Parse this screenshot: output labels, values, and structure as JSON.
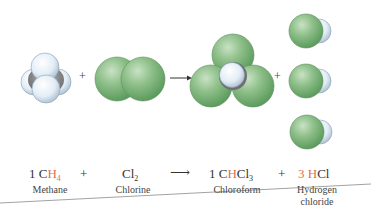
{
  "equation": {
    "reactants": [
      {
        "coef": "1",
        "formula_main": "C",
        "formula_hl": "H",
        "formula_sub": "4",
        "name": "Methane"
      },
      {
        "coef": "",
        "formula_main": "Cl",
        "formula_sub": "2",
        "name": "Chlorine"
      }
    ],
    "products": [
      {
        "coef": "1",
        "pre": "C",
        "hl": "H",
        "post": "Cl",
        "sub": "3",
        "name": "Chloroform"
      },
      {
        "coef": "3",
        "hl": "H",
        "post": "Cl",
        "name_line1": "Hydrogen",
        "name_line2": "chloride"
      }
    ],
    "plus_sign": "+",
    "arrow": "⟶",
    "scene_plus": "+"
  },
  "colors": {
    "highlight": "#e0704f",
    "chlorine": "#7fb07f",
    "hydrogen": "#dde8f2",
    "carbon": "#8a8a8a",
    "text": "#333333"
  }
}
